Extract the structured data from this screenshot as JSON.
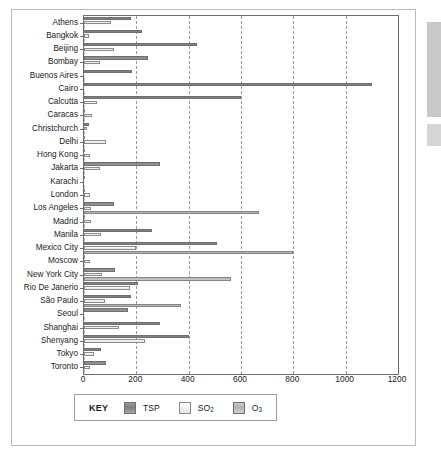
{
  "chart_data": {
    "type": "bar",
    "orientation": "horizontal",
    "title": "",
    "xlabel": "",
    "ylabel": "",
    "xlim": [
      0,
      1200
    ],
    "xticks": [
      0,
      200,
      400,
      600,
      800,
      1000,
      1200
    ],
    "xtick_labels": [
      "0",
      "200",
      "400",
      "600",
      "800",
      "1000",
      "1200"
    ],
    "grid": "vertical-dashed",
    "legend_position": "below-plot",
    "categories": [
      "Athens",
      "Bangkok",
      "Beijing",
      "Bombay",
      "Buenos Aires",
      "Cairo",
      "Calcutta",
      "Caracas",
      "Christchurch",
      "Delhi",
      "Hong Kong",
      "Jakarta",
      "Karachi",
      "London",
      "Los Angeles",
      "Madrid",
      "Manila",
      "Mexico City",
      "Moscow",
      "New York City",
      "Rio De Janerio",
      "São Paulo",
      "Seoul",
      "Shanghai",
      "Shenyang",
      "Tokyo",
      "Toronto"
    ],
    "series": [
      {
        "name": "TSP",
        "color": "#8d8d8d",
        "values": [
          178,
          223,
          430,
          243,
          185,
          1100,
          600,
          0,
          18,
          0,
          0,
          290,
          0,
          0,
          115,
          0,
          260,
          510,
          0,
          120,
          205,
          180,
          170,
          290,
          400,
          65,
          85
        ]
      },
      {
        "name": "SO2",
        "color": "#f2f2f2",
        "values": [
          105,
          20,
          115,
          62,
          0,
          0,
          48,
          32,
          12,
          83,
          22,
          62,
          0,
          22,
          25,
          25,
          65,
          200,
          22,
          70,
          175,
          80,
          0,
          135,
          235,
          40,
          22
        ]
      },
      {
        "name": "O3",
        "color": "#bfbfbf",
        "values": [
          0,
          0,
          0,
          0,
          0,
          0,
          0,
          0,
          0,
          0,
          0,
          0,
          0,
          0,
          670,
          0,
          0,
          800,
          0,
          560,
          0,
          370,
          0,
          0,
          0,
          0,
          0
        ]
      }
    ]
  },
  "legend": {
    "key_label": "KEY",
    "items": [
      {
        "label": "TSP",
        "sub": "",
        "swatch": "tsp"
      },
      {
        "label": "SO",
        "sub": "2",
        "swatch": "so2"
      },
      {
        "label": "O",
        "sub": "3",
        "swatch": "o3"
      }
    ]
  }
}
